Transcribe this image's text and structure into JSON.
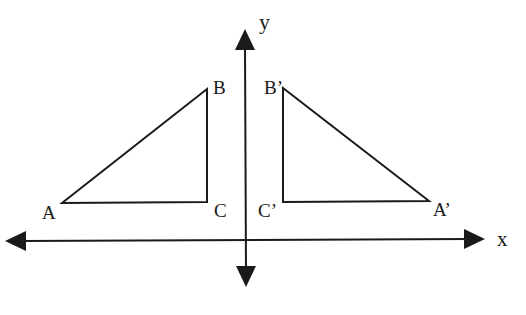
{
  "diagram": {
    "type": "reflection-over-y-axis",
    "axes": {
      "x_label": "x",
      "y_label": "y"
    },
    "original_triangle": {
      "vertices": [
        "A",
        "B",
        "C"
      ]
    },
    "reflected_triangle": {
      "vertices": [
        "A’",
        "B’",
        "C’"
      ]
    },
    "labels": {
      "A": "A",
      "B": "B",
      "C": "C",
      "A_prime": "A’",
      "B_prime": "B’",
      "C_prime": "C’",
      "x": "x",
      "y": "y"
    },
    "colors": {
      "stroke": "#1a1a1a",
      "background": "#ffffff"
    }
  }
}
